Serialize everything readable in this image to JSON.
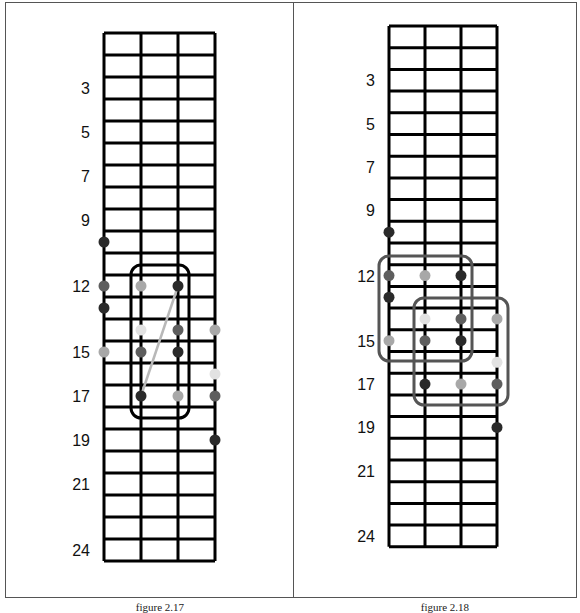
{
  "colors": {
    "grid": "#000000",
    "dot_dark": "#2a2a2a",
    "dot_mid": "#5e5e5e",
    "dot_light": "#a8a8a8",
    "dot_faint": "#e2e2e2",
    "box_left": "#000000",
    "box_right": "#555555",
    "connector": "#b8b8b8"
  },
  "figures": [
    {
      "id": "fig-2-17",
      "caption": "figure 2.17",
      "grid": {
        "left": 104,
        "top": 33,
        "string_spacing": 37,
        "fret_height": 22,
        "strings": 4,
        "frets": 24
      },
      "fret_labels": [
        {
          "fret": 3,
          "label": "3"
        },
        {
          "fret": 5,
          "label": "5"
        },
        {
          "fret": 7,
          "label": "7"
        },
        {
          "fret": 9,
          "label": "9"
        },
        {
          "fret": 12,
          "label": "12"
        },
        {
          "fret": 15,
          "label": "15"
        },
        {
          "fret": 17,
          "label": "17"
        },
        {
          "fret": 19,
          "label": "19"
        },
        {
          "fret": 21,
          "label": "21"
        },
        {
          "fret": 24,
          "label": "24"
        }
      ],
      "dots": [
        {
          "string": 1,
          "fret": 10,
          "shade": "dot_dark"
        },
        {
          "string": 1,
          "fret": 12,
          "shade": "dot_mid"
        },
        {
          "string": 2,
          "fret": 12,
          "shade": "dot_light"
        },
        {
          "string": 3,
          "fret": 12,
          "shade": "dot_dark"
        },
        {
          "string": 1,
          "fret": 13,
          "shade": "dot_dark"
        },
        {
          "string": 2,
          "fret": 14,
          "shade": "dot_faint"
        },
        {
          "string": 3,
          "fret": 14,
          "shade": "dot_mid"
        },
        {
          "string": 4,
          "fret": 14,
          "shade": "dot_light"
        },
        {
          "string": 1,
          "fret": 15,
          "shade": "dot_light"
        },
        {
          "string": 2,
          "fret": 15,
          "shade": "dot_mid"
        },
        {
          "string": 3,
          "fret": 15,
          "shade": "dot_dark"
        },
        {
          "string": 4,
          "fret": 16,
          "shade": "dot_faint"
        },
        {
          "string": 2,
          "fret": 17,
          "shade": "dot_dark"
        },
        {
          "string": 3,
          "fret": 17,
          "shade": "dot_light"
        },
        {
          "string": 4,
          "fret": 17,
          "shade": "dot_mid"
        },
        {
          "string": 4,
          "fret": 19,
          "shade": "dot_dark"
        }
      ],
      "boxes": [
        {
          "x": 131,
          "y": 265,
          "w": 58,
          "h": 153,
          "color": "box_left"
        }
      ],
      "connectors": [
        {
          "from": {
            "string": 3,
            "fret": 12
          },
          "to": {
            "string": 2,
            "fret": 17
          },
          "color": "connector"
        }
      ]
    },
    {
      "id": "fig-2-18",
      "caption": "figure 2.18",
      "grid": {
        "left": 389,
        "top": 26,
        "string_spacing": 36,
        "fret_height": 21.7,
        "strings": 4,
        "frets": 24
      },
      "fret_labels": [
        {
          "fret": 3,
          "label": "3"
        },
        {
          "fret": 5,
          "label": "5"
        },
        {
          "fret": 7,
          "label": "7"
        },
        {
          "fret": 9,
          "label": "9"
        },
        {
          "fret": 12,
          "label": "12"
        },
        {
          "fret": 15,
          "label": "15"
        },
        {
          "fret": 17,
          "label": "17"
        },
        {
          "fret": 19,
          "label": "19"
        },
        {
          "fret": 21,
          "label": "21"
        },
        {
          "fret": 24,
          "label": "24"
        }
      ],
      "dots": [
        {
          "string": 1,
          "fret": 10,
          "shade": "dot_dark"
        },
        {
          "string": 1,
          "fret": 12,
          "shade": "dot_mid"
        },
        {
          "string": 2,
          "fret": 12,
          "shade": "dot_light"
        },
        {
          "string": 3,
          "fret": 12,
          "shade": "dot_dark"
        },
        {
          "string": 1,
          "fret": 13,
          "shade": "dot_dark"
        },
        {
          "string": 2,
          "fret": 14,
          "shade": "dot_faint"
        },
        {
          "string": 3,
          "fret": 14,
          "shade": "dot_mid"
        },
        {
          "string": 4,
          "fret": 14,
          "shade": "dot_light"
        },
        {
          "string": 1,
          "fret": 15,
          "shade": "dot_light"
        },
        {
          "string": 2,
          "fret": 15,
          "shade": "dot_mid"
        },
        {
          "string": 3,
          "fret": 15,
          "shade": "dot_dark"
        },
        {
          "string": 4,
          "fret": 16,
          "shade": "dot_faint"
        },
        {
          "string": 2,
          "fret": 17,
          "shade": "dot_dark"
        },
        {
          "string": 3,
          "fret": 17,
          "shade": "dot_light"
        },
        {
          "string": 4,
          "fret": 17,
          "shade": "dot_mid"
        },
        {
          "string": 4,
          "fret": 19,
          "shade": "dot_dark"
        }
      ],
      "boxes": [
        {
          "x": 379,
          "y": 256,
          "w": 93,
          "h": 105,
          "color": "box_right"
        },
        {
          "x": 414,
          "y": 298,
          "w": 94,
          "h": 107,
          "color": "box_right"
        }
      ],
      "connectors": []
    }
  ]
}
